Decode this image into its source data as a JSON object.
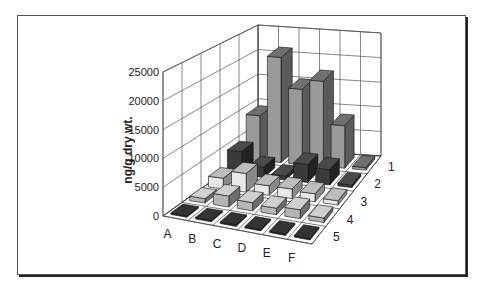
{
  "chart_data": {
    "type": "bar3d",
    "title": "",
    "ylabel": "ng/g dry wt.",
    "xlabel": "",
    "ylim": [
      0,
      25000
    ],
    "yticks": [
      0,
      5000,
      10000,
      15000,
      20000,
      25000
    ],
    "categories": [
      "A",
      "B",
      "C",
      "D",
      "E",
      "F"
    ],
    "series": [
      {
        "name": "1",
        "values": [
          9000,
          21000,
          15000,
          17000,
          8500,
          500
        ]
      },
      {
        "name": "2",
        "values": [
          4500,
          2000,
          800,
          3500,
          3000,
          500
        ]
      },
      {
        "name": "3",
        "values": [
          2000,
          3500,
          1800,
          1800,
          1500,
          800
        ]
      },
      {
        "name": "4",
        "values": [
          800,
          2000,
          1500,
          1200,
          1600,
          800
        ]
      },
      {
        "name": "5",
        "values": [
          150,
          150,
          150,
          150,
          150,
          150
        ]
      }
    ],
    "grid": true,
    "legend": "depth-axis labels 1-5 on right"
  },
  "labels": {
    "ylabel": "ng/g dry wt.",
    "yticks": [
      "0",
      "5000",
      "10000",
      "15000",
      "20000",
      "25000"
    ],
    "categories": [
      "A",
      "B",
      "C",
      "D",
      "E",
      "F"
    ],
    "rows": [
      "1",
      "2",
      "3",
      "4",
      "5"
    ]
  }
}
